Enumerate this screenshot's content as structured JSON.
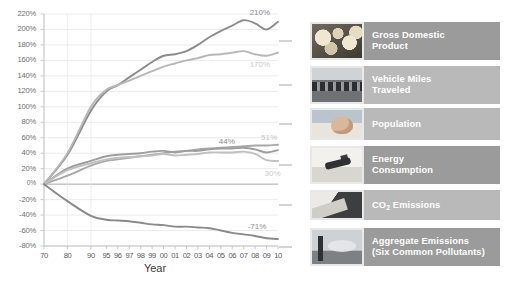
{
  "chart_data": {
    "type": "line",
    "title": "",
    "xlabel": "Year",
    "ylabel": "",
    "ylim": [
      -80,
      220
    ],
    "ytick_step": 20,
    "grid": true,
    "zero_line": true,
    "x": [
      "70",
      "80",
      "90",
      "95",
      "96",
      "97",
      "98",
      "99",
      "00",
      "01",
      "02",
      "03",
      "04",
      "05",
      "06",
      "07",
      "08",
      "09",
      "10"
    ],
    "yticks": [
      "220%",
      "200%",
      "180%",
      "160%",
      "140%",
      "120%",
      "100%",
      "80%",
      "60%",
      "40%",
      "20%",
      "0%",
      "-20%",
      "-40%",
      "-60%",
      "-80%"
    ],
    "xticks": [
      "70",
      "80",
      "90",
      "95",
      "96",
      "97",
      "98",
      "99",
      "00",
      "01",
      "02",
      "03",
      "04",
      "05",
      "06",
      "07",
      "08",
      "09",
      "10"
    ],
    "legend_position": "right",
    "series": [
      {
        "name": "Gross Domestic Product",
        "color": "#8c8c8c",
        "end_label": "210%",
        "values": [
          0,
          38,
          95,
          120,
          128,
          138,
          148,
          158,
          166,
          168,
          172,
          180,
          190,
          198,
          205,
          212,
          208,
          200,
          210
        ]
      },
      {
        "name": "Vehicle Miles Traveled",
        "color": "#b7b7b7",
        "end_label": "170%",
        "values": [
          0,
          40,
          100,
          122,
          128,
          134,
          140,
          146,
          152,
          156,
          160,
          163,
          167,
          168,
          170,
          172,
          168,
          166,
          170
        ]
      },
      {
        "name": "Population",
        "color": "#a8a8a8",
        "end_label": "51%",
        "values": [
          0,
          11,
          24,
          30,
          32,
          34,
          36,
          38,
          40,
          42,
          43,
          45,
          46,
          47,
          48,
          49,
          50,
          50,
          51
        ]
      },
      {
        "name": "Energy Consumption",
        "color": "#9d9d9d",
        "end_label": "44%",
        "values": [
          0,
          20,
          30,
          36,
          38,
          39,
          40,
          42,
          43,
          41,
          43,
          43,
          45,
          46,
          46,
          47,
          45,
          41,
          44
        ]
      },
      {
        "name": "CO2 Emissions",
        "color": "#c0c0c0",
        "end_label": "30%",
        "values": [
          0,
          18,
          27,
          32,
          34,
          35,
          36,
          37,
          39,
          37,
          38,
          39,
          41,
          41,
          41,
          42,
          39,
          31,
          30
        ]
      },
      {
        "name": "Aggregate Emissions (Six Common Pollutants)",
        "color": "#8a8a8a",
        "end_label": "-71%",
        "values": [
          0,
          -22,
          -41,
          -46,
          -47,
          -48,
          -50,
          -52,
          -53,
          -55,
          -55,
          -56,
          -57,
          -60,
          -63,
          -65,
          -67,
          -70,
          -71
        ]
      }
    ]
  },
  "axis": {
    "x_title": "Year"
  },
  "legend": {
    "items": [
      {
        "label_line1": "Gross Domestic",
        "label_line2": "Product",
        "shade": "dark",
        "thumb": "coins-image"
      },
      {
        "label_line1": "Vehicle Miles",
        "label_line2": "Traveled",
        "shade": "light",
        "thumb": "traffic-image"
      },
      {
        "label_line1": "Population",
        "label_line2": "",
        "shade": "light",
        "thumb": "baby-image"
      },
      {
        "label_line1": "Energy",
        "label_line2": "Consumption",
        "shade": "dark",
        "thumb": "gas-pump-image"
      },
      {
        "label_line1": "CO2 Emissions",
        "label_line2": "",
        "shade": "light",
        "thumb": "smokestack-dark-image"
      },
      {
        "label_line1": "Aggregate Emissions",
        "label_line2": "(Six Common Pollutants)",
        "shade": "dark",
        "thumb": "factory-stacks-image"
      }
    ]
  },
  "colors": {
    "axis": "#bdbdbd",
    "grid": "#d8d8d8",
    "tick_text": "#6f6f6f",
    "legend_dark": "#9b9b9b",
    "legend_light": "#b9b9b9"
  }
}
